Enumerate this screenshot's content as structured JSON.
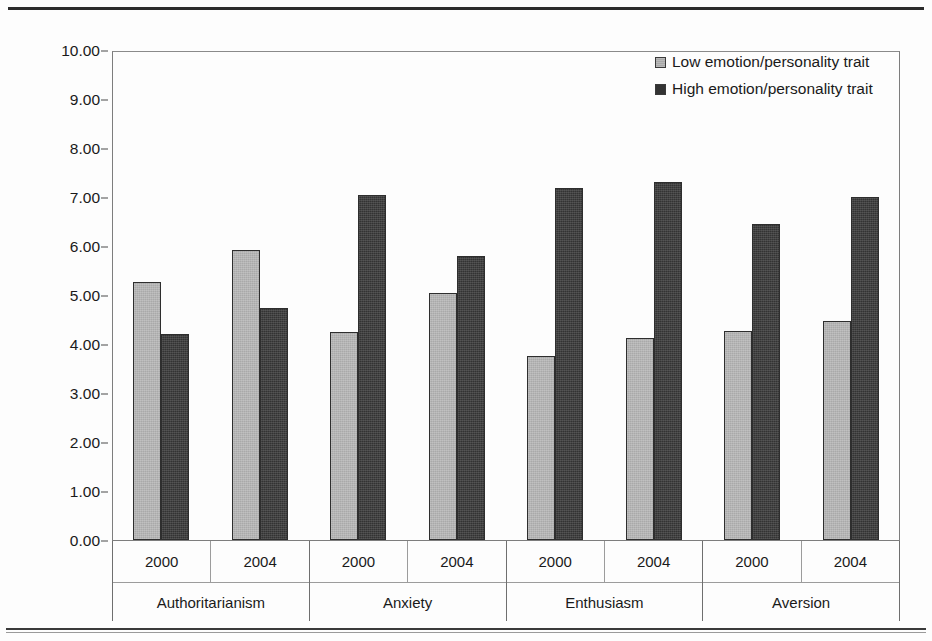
{
  "chart_data": {
    "type": "bar",
    "title": "",
    "xlabel": "",
    "ylabel": "Number of comments about candidates",
    "ylim": [
      0,
      10
    ],
    "ytick_step": 1,
    "ytick_labels": [
      "10.00",
      "9.00",
      "8.00",
      "7.00",
      "6.00",
      "5.00",
      "4.00",
      "3.00",
      "2.00",
      "1.00",
      "0.00"
    ],
    "ytick_values": [
      10,
      9,
      8,
      7,
      6,
      5,
      4,
      3,
      2,
      1,
      0
    ],
    "grid": false,
    "legend_position": "top-right",
    "legend": [
      "Low emotion/personality trait",
      "High emotion/personality trait"
    ],
    "groups": [
      "Authoritarianism",
      "Anxiety",
      "Enthusiasm",
      "Aversion"
    ],
    "subcategories": [
      "2000",
      "2004"
    ],
    "categories": [
      "Authoritarianism 2000",
      "Authoritarianism 2004",
      "Anxiety 2000",
      "Anxiety 2004",
      "Enthusiasm 2000",
      "Enthusiasm 2004",
      "Aversion 2000",
      "Aversion 2004"
    ],
    "series": [
      {
        "name": "Low emotion/personality trait",
        "color": "#a9a9a9",
        "values": [
          5.27,
          5.92,
          4.25,
          5.05,
          3.75,
          4.13,
          4.27,
          4.47
        ]
      },
      {
        "name": "High emotion/personality trait",
        "color": "#333333",
        "values": [
          4.21,
          4.74,
          7.05,
          5.8,
          7.18,
          7.3,
          6.45,
          7.0
        ]
      }
    ],
    "grouped_values": [
      {
        "group": "Authoritarianism",
        "years": [
          {
            "year": "2000",
            "low": 5.27,
            "high": 4.21
          },
          {
            "year": "2004",
            "low": 5.92,
            "high": 4.74
          }
        ]
      },
      {
        "group": "Anxiety",
        "years": [
          {
            "year": "2000",
            "low": 4.25,
            "high": 7.05
          },
          {
            "year": "2004",
            "low": 5.05,
            "high": 5.8
          }
        ]
      },
      {
        "group": "Enthusiasm",
        "years": [
          {
            "year": "2000",
            "low": 3.75,
            "high": 7.18
          },
          {
            "year": "2004",
            "low": 4.13,
            "high": 7.3
          }
        ]
      },
      {
        "group": "Aversion",
        "years": [
          {
            "year": "2000",
            "low": 4.27,
            "high": 6.45
          },
          {
            "year": "2004",
            "low": 4.47,
            "high": 7.0
          }
        ]
      }
    ]
  },
  "colors": {
    "low_trait": "#a9a9a9",
    "high_trait": "#333333",
    "bar_border": "#2e2e2e",
    "frame": "#7d7d7d",
    "text": "#1a1a1a"
  }
}
